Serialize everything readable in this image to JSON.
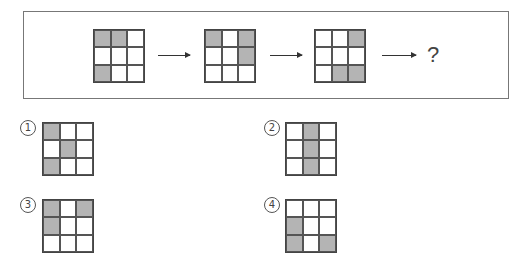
{
  "sequence": {
    "grids": [
      {
        "shaded": [
          [
            1,
            1,
            0
          ],
          [
            0,
            0,
            0
          ],
          [
            1,
            0,
            0
          ]
        ]
      },
      {
        "shaded": [
          [
            1,
            0,
            1
          ],
          [
            0,
            0,
            1
          ],
          [
            0,
            0,
            0
          ]
        ]
      },
      {
        "shaded": [
          [
            0,
            0,
            1
          ],
          [
            0,
            0,
            0
          ],
          [
            0,
            1,
            1
          ]
        ]
      }
    ],
    "question_mark": "?"
  },
  "options": [
    {
      "label": "1",
      "shaded": [
        [
          1,
          0,
          0
        ],
        [
          0,
          1,
          0
        ],
        [
          1,
          0,
          0
        ]
      ]
    },
    {
      "label": "2",
      "shaded": [
        [
          0,
          1,
          0
        ],
        [
          0,
          1,
          0
        ],
        [
          0,
          1,
          0
        ]
      ]
    },
    {
      "label": "3",
      "shaded": [
        [
          1,
          0,
          1
        ],
        [
          1,
          0,
          0
        ],
        [
          0,
          0,
          0
        ]
      ]
    },
    {
      "label": "4",
      "shaded": [
        [
          0,
          0,
          0
        ],
        [
          1,
          0,
          0
        ],
        [
          1,
          0,
          1
        ]
      ]
    }
  ],
  "colors": {
    "shaded": "#b4b4b4",
    "line": "#444444"
  }
}
